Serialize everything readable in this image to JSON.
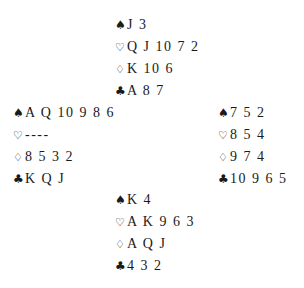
{
  "deal": {
    "north": {
      "spades": {
        "symbol": "♠",
        "cards": "J 3"
      },
      "hearts": {
        "symbol": "♡",
        "cards": "Q J 10 7 2"
      },
      "diamonds": {
        "symbol": "♢",
        "cards": "K 10 6"
      },
      "clubs": {
        "symbol": "♣",
        "cards": "A 8 7"
      }
    },
    "west": {
      "spades": {
        "symbol": "♠",
        "cards": "A Q 10 9 8 6"
      },
      "hearts": {
        "symbol": "♡",
        "cards": "----"
      },
      "diamonds": {
        "symbol": "♢",
        "cards": "8 5 3 2"
      },
      "clubs": {
        "symbol": "♣",
        "cards": "K Q J"
      }
    },
    "east": {
      "spades": {
        "symbol": "♠",
        "cards": "7 5 2"
      },
      "hearts": {
        "symbol": "♡",
        "cards": "8 5 4"
      },
      "diamonds": {
        "symbol": "♢",
        "cards": "9 7 4"
      },
      "clubs": {
        "symbol": "♣",
        "cards": "10 9 6 5"
      }
    },
    "south": {
      "spades": {
        "symbol": "♠",
        "cards": "K 4"
      },
      "hearts": {
        "symbol": "♡",
        "cards": "A K 9 6 3"
      },
      "diamonds": {
        "symbol": "♢",
        "cards": "A Q J"
      },
      "clubs": {
        "symbol": "♣",
        "cards": "4 3 2"
      }
    }
  },
  "icons": {
    "spades": "spade-icon",
    "hearts": "heart-outline-icon",
    "diamonds": "diamond-outline-icon",
    "clubs": "club-icon"
  },
  "colors": {
    "background": "#ffffff",
    "text": "#1a1a1a"
  }
}
